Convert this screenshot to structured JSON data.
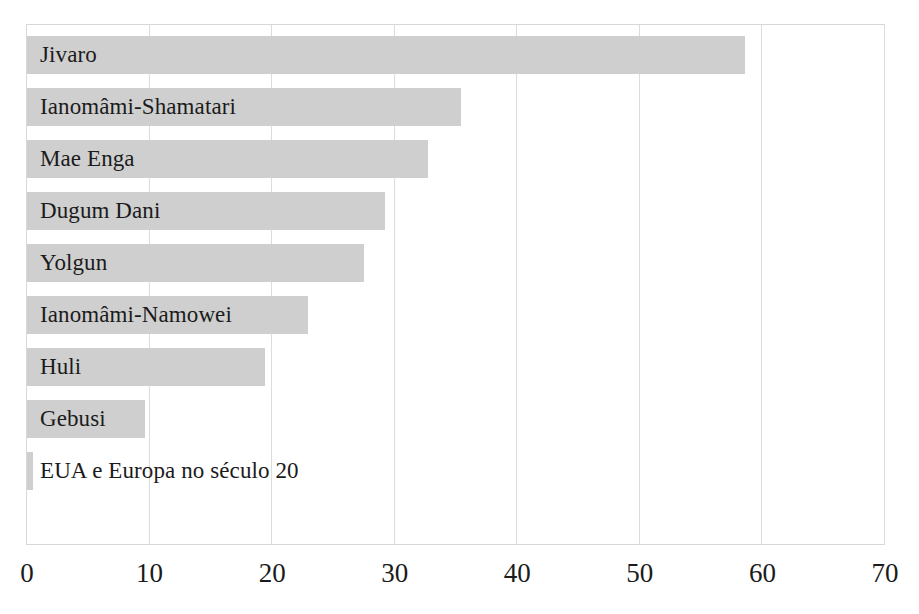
{
  "figure": {
    "top_clipped_text": "",
    "background_color": "#ffffff",
    "bar_color": "#cfcfcf",
    "gridline_color": "#dcdcdc",
    "frame_color": "#d8d8d8",
    "text_color": "#1b1b1b"
  },
  "chart_data": {
    "type": "bar",
    "orientation": "horizontal",
    "title": "",
    "subtitle": "",
    "xlabel": "",
    "ylabel": "",
    "xlim": [
      0,
      70
    ],
    "ylim": null,
    "grid": true,
    "gridlines_axis": "x",
    "legend": null,
    "legend_position": "none",
    "xticks": [
      0,
      10,
      20,
      30,
      40,
      50,
      60,
      70
    ],
    "xticklabels": [
      "0",
      "10",
      "20",
      "30",
      "40",
      "50",
      "60",
      "70"
    ],
    "categories": [
      "Jivaro",
      "Ianomâmi-Shamatari",
      "Mae Enga",
      "Dugum Dani",
      "Yolgun",
      "Ianomâmi-Namowei",
      "Huli",
      "Gebusi",
      "EUA e Europa no século 20"
    ],
    "values": [
      58.6,
      35.4,
      32.7,
      29.2,
      27.5,
      22.9,
      19.4,
      9.6,
      0.5
    ],
    "series": [
      {
        "name": "",
        "values": [
          58.6,
          35.4,
          32.7,
          29.2,
          27.5,
          22.9,
          19.4,
          9.6,
          0.5
        ]
      }
    ],
    "annotations": []
  }
}
